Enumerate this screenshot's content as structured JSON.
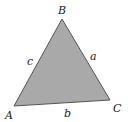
{
  "figure": {
    "type": "triangle",
    "fill_color": "#a9a9a9",
    "stroke_color": "#555555",
    "vertices": {
      "A": {
        "label": "A",
        "x": 14,
        "y": 106
      },
      "B": {
        "label": "B",
        "x": 62,
        "y": 19
      },
      "C": {
        "label": "C",
        "x": 110,
        "y": 100
      }
    },
    "sides": {
      "a": {
        "label": "a",
        "between": "B-C"
      },
      "b": {
        "label": "b",
        "between": "A-C"
      },
      "c": {
        "label": "c",
        "between": "A-B"
      }
    }
  }
}
